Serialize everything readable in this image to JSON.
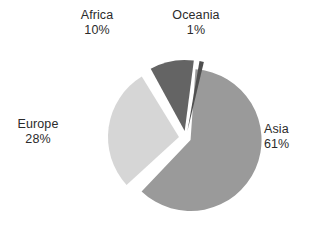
{
  "chart_data": {
    "type": "pie",
    "title": "",
    "subtitle": "",
    "xlabel": "",
    "ylabel": "",
    "grid": false,
    "legend_position": "none",
    "label_format": "name-over-percent",
    "exploded": true,
    "background_color": "#ffffff",
    "text_color": "#2b2b2b",
    "categories": [
      "Asia",
      "Europe",
      "Africa",
      "Oceania"
    ],
    "values": [
      61,
      28,
      10,
      1
    ],
    "unit": "%",
    "slices": [
      {
        "name": "Asia",
        "value": 61,
        "value_label": "61%",
        "color": "#9a9a9a",
        "start_angle_deg": 4,
        "end_angle_deg": 223.6,
        "explode": 0.07,
        "label_position": "right"
      },
      {
        "name": "Europe",
        "value": 28,
        "value_label": "28%",
        "color": "#d6d6d6",
        "start_angle_deg": 227.6,
        "end_angle_deg": 328.4,
        "explode": 0.1,
        "label_position": "left"
      },
      {
        "name": "Africa",
        "value": 10,
        "value_label": "10%",
        "color": "#646464",
        "start_angle_deg": 331.4,
        "end_angle_deg": 367.4,
        "explode": 0.1,
        "label_position": "top-left"
      },
      {
        "name": "Oceania",
        "value": 1,
        "value_label": "1%",
        "color": "#4f4f4f",
        "start_angle_deg": 369.8,
        "end_angle_deg": 373.4,
        "explode": 0.1,
        "label_position": "top-right"
      }
    ],
    "geometry": {
      "center_x": 186,
      "center_y": 138,
      "radius": 71
    }
  },
  "labels": {
    "asia": {
      "name": "Asia",
      "value": "61%"
    },
    "europe": {
      "name": "Europe",
      "value": "28%"
    },
    "africa": {
      "name": "Africa",
      "value": "10%"
    },
    "oceania": {
      "name": "Oceania",
      "value": "1%"
    }
  }
}
